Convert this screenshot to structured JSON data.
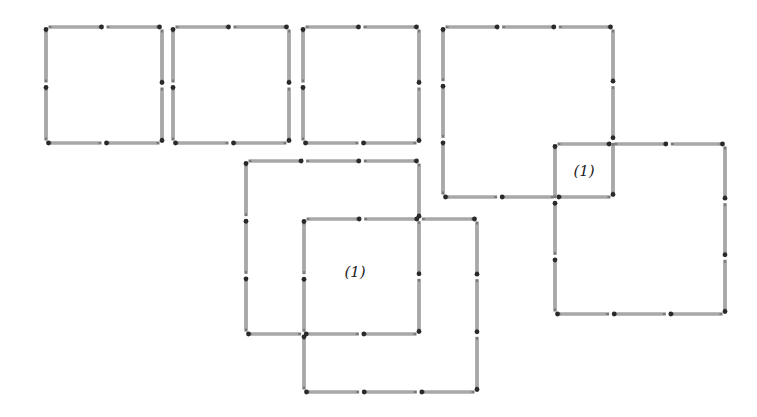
{
  "figure": {
    "type": "matchstick-puzzle",
    "colors": {
      "stick": "#7a7a7a",
      "head": "#2a2a2a",
      "background": "#ffffff"
    },
    "groups": [
      {
        "id": "three-small-squares",
        "description": "Three separate squares, 2 matches per side"
      },
      {
        "id": "lower-left-overlap",
        "description": "Two 3x3 squares overlapping forming a 2x2 area"
      },
      {
        "id": "right-overlap",
        "description": "Two 3x3 squares overlapping at one corner cell"
      }
    ],
    "labels": [
      {
        "id": "label-lower-left",
        "text": "(1)"
      },
      {
        "id": "label-right",
        "text": "(1)"
      }
    ]
  }
}
